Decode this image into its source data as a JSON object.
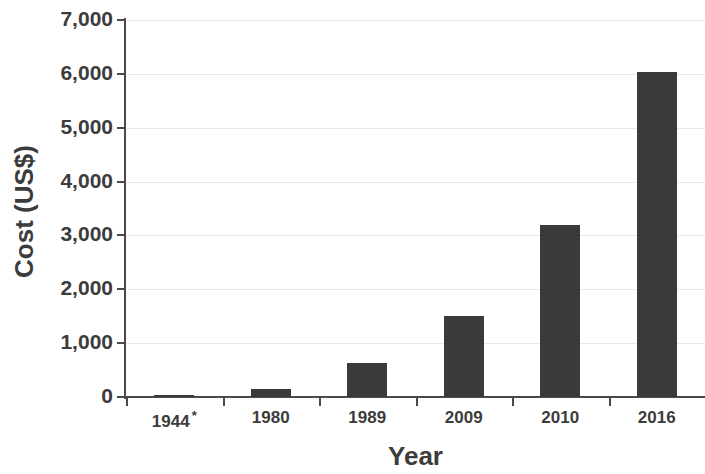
{
  "chart_data": {
    "type": "bar",
    "title": "",
    "subtitle": "",
    "xlabel": "Year",
    "ylabel": "Cost (US$)",
    "categories": [
      "1944 *",
      "1980",
      "1989",
      "2009",
      "2010",
      "2016"
    ],
    "category_labels": [
      {
        "text": "1944",
        "footnote_marker": "*"
      },
      {
        "text": "1980",
        "footnote_marker": ""
      },
      {
        "text": "1989",
        "footnote_marker": ""
      },
      {
        "text": "2009",
        "footnote_marker": ""
      },
      {
        "text": "2010",
        "footnote_marker": ""
      },
      {
        "text": "2016",
        "footnote_marker": ""
      }
    ],
    "values": [
      30,
      150,
      630,
      1500,
      3200,
      6030
    ],
    "ylim": [
      0,
      7000
    ],
    "ytick_values": [
      0,
      1000,
      2000,
      3000,
      4000,
      5000,
      6000,
      7000
    ],
    "ytick_labels": [
      "0",
      "1,000",
      "2,000",
      "3,000",
      "4,000",
      "5,000",
      "6,000",
      "7,000"
    ],
    "grid": true,
    "grid_axis": "y",
    "legend": false,
    "legend_position": "none",
    "bar_color": "#3a3a3a",
    "axis_color": "#4a4a4a",
    "gridline_color": "#e8e8e8",
    "background_color": "#ffffff"
  }
}
